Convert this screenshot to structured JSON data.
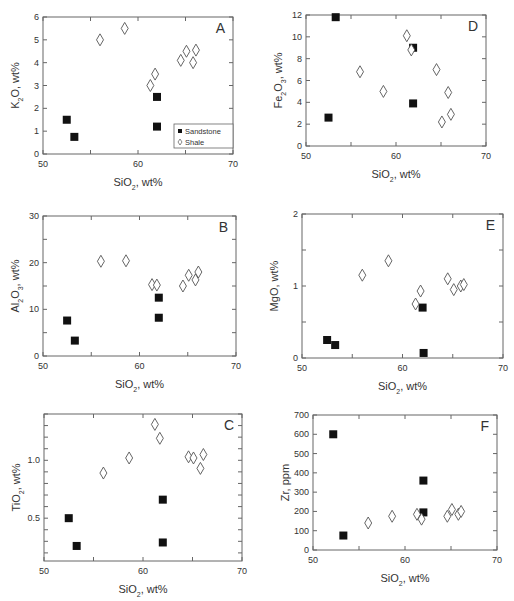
{
  "figure": {
    "legend": {
      "sandstone": "Sandstone",
      "shale": "Shale"
    },
    "xlabel": "SiO₂, wt%"
  },
  "chart_data": [
    {
      "panel": "A",
      "type": "scatter",
      "xlabel": "SiO2, wt%",
      "ylabel": "K2O, wt%",
      "xlim": [
        50,
        70
      ],
      "ylim": [
        0,
        6
      ],
      "xticks": [
        50,
        60,
        70
      ],
      "yticks": [
        0,
        1,
        2,
        3,
        4,
        5,
        6
      ],
      "legend": {
        "position": "lower right",
        "entries": [
          "Sandstone",
          "Shale"
        ]
      },
      "box": {
        "x0": 43,
        "y0": 17,
        "x1": 233,
        "y1": 154
      },
      "series": [
        {
          "name": "Sandstone",
          "marker": "filled-square",
          "points": [
            [
              52.5,
              1.5
            ],
            [
              53.3,
              0.75
            ],
            [
              62.0,
              2.5
            ],
            [
              62.0,
              1.2
            ]
          ]
        },
        {
          "name": "Shale",
          "marker": "open-diamond",
          "points": [
            [
              56.0,
              5.0
            ],
            [
              58.6,
              5.5
            ],
            [
              61.3,
              3.0
            ],
            [
              61.8,
              3.5
            ],
            [
              64.5,
              4.1
            ],
            [
              65.1,
              4.5
            ],
            [
              65.8,
              4.0
            ],
            [
              66.1,
              4.55
            ]
          ]
        }
      ]
    },
    {
      "panel": "D",
      "type": "scatter",
      "xlabel": "SiO2, wt%",
      "ylabel": "Fe2O3, wt%",
      "xlim": [
        50,
        70
      ],
      "ylim": [
        0,
        12
      ],
      "xticks": [
        50,
        60,
        70
      ],
      "yticks": [
        0,
        2,
        4,
        6,
        8,
        10,
        12
      ],
      "box": {
        "x0": 306,
        "y0": 15,
        "x1": 486,
        "y1": 146
      },
      "series": [
        {
          "name": "Sandstone",
          "marker": "filled-square",
          "points": [
            [
              52.5,
              2.6
            ],
            [
              53.3,
              11.8
            ],
            [
              61.9,
              9.0
            ],
            [
              61.9,
              3.9
            ]
          ]
        },
        {
          "name": "Shale",
          "marker": "open-diamond",
          "points": [
            [
              56.0,
              6.8
            ],
            [
              58.6,
              5.0
            ],
            [
              61.2,
              10.1
            ],
            [
              61.7,
              8.8
            ],
            [
              64.5,
              7.0
            ],
            [
              65.1,
              2.2
            ],
            [
              65.8,
              4.9
            ],
            [
              66.1,
              2.9
            ]
          ]
        }
      ]
    },
    {
      "panel": "B",
      "type": "scatter",
      "xlabel": "SiO2, wt%",
      "ylabel": "Al2O3, wt%",
      "xlim": [
        50,
        70
      ],
      "ylim": [
        0,
        30
      ],
      "xticks": [
        50,
        60,
        70
      ],
      "yticks": [
        0,
        10,
        20,
        30
      ],
      "box": {
        "x0": 43,
        "y0": 216,
        "x1": 236,
        "y1": 356
      },
      "series": [
        {
          "name": "Sandstone",
          "marker": "filled-square",
          "points": [
            [
              52.5,
              7.6
            ],
            [
              53.3,
              3.3
            ],
            [
              62.0,
              12.5
            ],
            [
              62.0,
              8.2
            ]
          ]
        },
        {
          "name": "Shale",
          "marker": "open-diamond",
          "points": [
            [
              56.0,
              20.3
            ],
            [
              58.6,
              20.4
            ],
            [
              61.3,
              15.3
            ],
            [
              61.8,
              15.2
            ],
            [
              64.5,
              15.0
            ],
            [
              65.1,
              17.3
            ],
            [
              65.8,
              16.3
            ],
            [
              66.1,
              18.0
            ]
          ]
        }
      ]
    },
    {
      "panel": "E",
      "type": "scatter",
      "xlabel": "SiO2, wt%",
      "ylabel": "MgO, wt%",
      "xlim": [
        50,
        70
      ],
      "ylim": [
        0,
        2
      ],
      "xticks": [
        50,
        60,
        70
      ],
      "yticks": [
        0,
        1,
        2
      ],
      "box": {
        "x0": 302,
        "y0": 214,
        "x1": 503,
        "y1": 358
      },
      "series": [
        {
          "name": "Sandstone",
          "marker": "filled-square",
          "points": [
            [
              52.5,
              0.25
            ],
            [
              53.3,
              0.18
            ],
            [
              62.0,
              0.7
            ],
            [
              62.1,
              0.07
            ]
          ]
        },
        {
          "name": "Shale",
          "marker": "open-diamond",
          "points": [
            [
              56.0,
              1.15
            ],
            [
              58.6,
              1.35
            ],
            [
              61.3,
              0.75
            ],
            [
              61.8,
              0.93
            ],
            [
              64.5,
              1.1
            ],
            [
              65.1,
              0.95
            ],
            [
              65.8,
              1.0
            ],
            [
              66.1,
              1.02
            ]
          ]
        }
      ]
    },
    {
      "panel": "C",
      "type": "scatter",
      "xlabel": "SiO2, wt%",
      "ylabel": "TiO2, wt%",
      "xlim": [
        50,
        70
      ],
      "ylim": [
        0.13,
        1.4
      ],
      "xticks": [
        50,
        60,
        70
      ],
      "yticks": [
        0.5,
        1.0
      ],
      "box": {
        "x0": 44,
        "y0": 414,
        "x1": 242,
        "y1": 561
      },
      "series": [
        {
          "name": "Sandstone",
          "marker": "filled-square",
          "points": [
            [
              52.5,
              0.5
            ],
            [
              53.3,
              0.26
            ],
            [
              62.0,
              0.66
            ],
            [
              62.0,
              0.29
            ]
          ]
        },
        {
          "name": "Shale",
          "marker": "open-diamond",
          "points": [
            [
              56.0,
              0.89
            ],
            [
              58.6,
              1.02
            ],
            [
              61.2,
              1.31
            ],
            [
              61.7,
              1.19
            ],
            [
              64.6,
              1.03
            ],
            [
              65.1,
              1.02
            ],
            [
              65.8,
              0.93
            ],
            [
              66.1,
              1.05
            ]
          ]
        }
      ]
    },
    {
      "panel": "F",
      "type": "scatter",
      "xlabel": "SiO2, wt%",
      "ylabel": "Zr, ppm",
      "xlim": [
        50,
        70
      ],
      "ylim": [
        0,
        700
      ],
      "xticks": [
        50,
        60,
        70
      ],
      "yticks": [
        0,
        100,
        200,
        300,
        400,
        500,
        600,
        700
      ],
      "box": {
        "x0": 313,
        "y0": 415,
        "x1": 497,
        "y1": 550
      },
      "series": [
        {
          "name": "Sandstone",
          "marker": "filled-square",
          "points": [
            [
              52.2,
              600
            ],
            [
              53.3,
              75
            ],
            [
              62.0,
              360
            ],
            [
              62.0,
              195
            ]
          ]
        },
        {
          "name": "Shale",
          "marker": "open-diamond",
          "points": [
            [
              56.0,
              140
            ],
            [
              58.6,
              175
            ],
            [
              61.3,
              185
            ],
            [
              61.8,
              160
            ],
            [
              64.6,
              175
            ],
            [
              65.1,
              210
            ],
            [
              65.8,
              185
            ],
            [
              66.1,
              200
            ]
          ]
        }
      ]
    }
  ]
}
